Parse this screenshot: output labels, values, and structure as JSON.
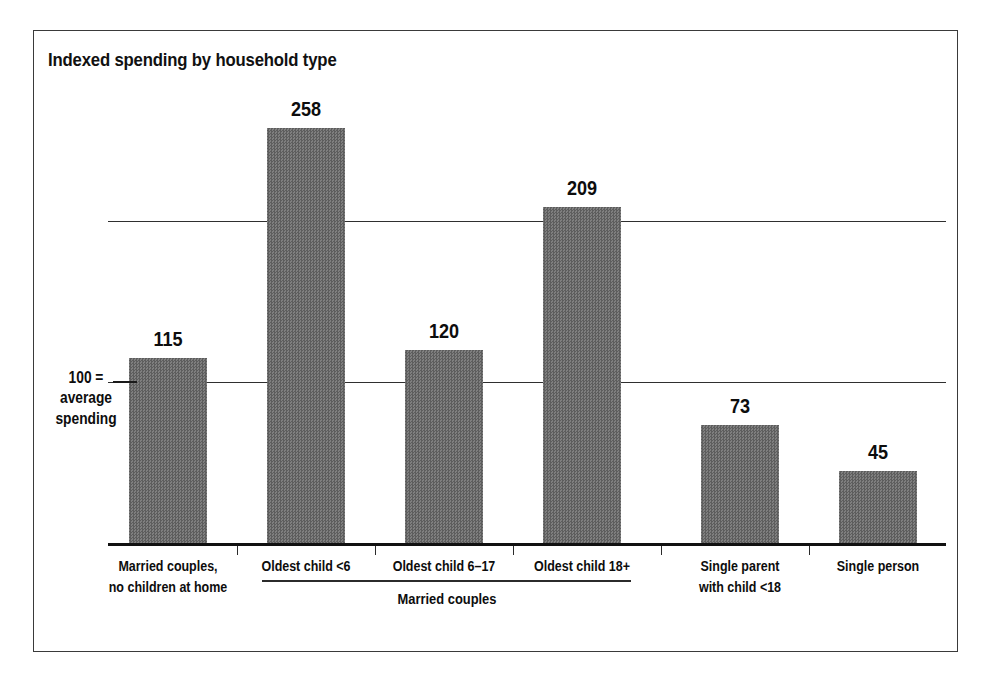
{
  "figure": {
    "border_color": "#3a3a3a",
    "background": "#ffffff"
  },
  "title": "Indexed spending by household type",
  "axis_note": {
    "line1": "100 =",
    "line2": "average",
    "line3": "spending"
  },
  "group_bracket": {
    "label": "Married couples",
    "spans_categories": [
      "Oldest child <6",
      "Oldest child 6–17",
      "Oldest child 18+"
    ]
  },
  "chart_data": {
    "type": "bar",
    "title": "Indexed spending by household type",
    "xlabel": "",
    "ylabel": "",
    "ylim": [
      0,
      290
    ],
    "grid": true,
    "gridlines": [
      100,
      200
    ],
    "legend": "none",
    "bar_color": "#6e6e6e",
    "categories": [
      "Married couples, no children at home",
      "Oldest child <6",
      "Oldest child 6–17",
      "Oldest child 18+",
      "Single parent with child <18",
      "Single person"
    ],
    "category_lines": [
      [
        "Married couples,",
        "no children at home"
      ],
      [
        "Oldest child <6"
      ],
      [
        "Oldest child 6–17"
      ],
      [
        "Oldest child 18+"
      ],
      [
        "Single parent",
        "with child <18"
      ],
      [
        "Single person"
      ]
    ],
    "values": [
      115,
      258,
      120,
      209,
      73,
      45
    ],
    "value_labels": [
      "115",
      "258",
      "120",
      "209",
      "73",
      "45"
    ]
  }
}
